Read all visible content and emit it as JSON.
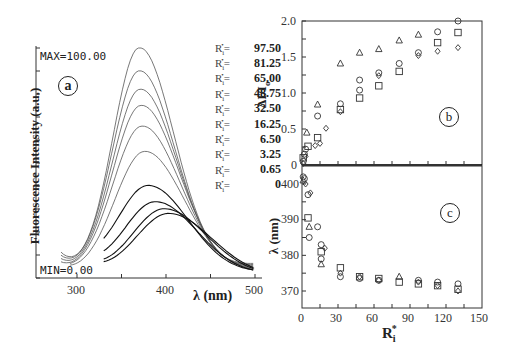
{
  "figure": {
    "panel_a": {
      "label": "a",
      "max_text": "MAX=100.00",
      "min_text": "MIN=0.00",
      "ylabel": "Fluorescence Intensity (a.u.)",
      "xlabel": "λ (nm)",
      "xticks": [
        "300",
        "400",
        "500"
      ],
      "legend_prefix": "Ri* =",
      "legend": [
        "97.50",
        "81.25",
        "65.00",
        "48.75",
        "32.50",
        "16.25",
        "6.50",
        "3.25",
        "0.65",
        "0"
      ]
    },
    "panel_b": {
      "label": "b",
      "ylabel": "ΔI/I0",
      "yticks": [
        "2.0",
        "1.5",
        "1.0",
        "0.5",
        "0"
      ]
    },
    "panel_c": {
      "label": "c",
      "ylabel": "λ (nm)",
      "yticks": [
        "400",
        "390",
        "380",
        "370"
      ],
      "xticks": [
        "0",
        "30",
        "60",
        "90",
        "120",
        "150"
      ],
      "xlabel": "Ri*"
    }
  },
  "chart_data": [
    {
      "type": "line",
      "title": "(a) Fluorescence emission spectra",
      "xlabel": "λ (nm)",
      "ylabel": "Fluorescence Intensity (a.u.)",
      "xlim": [
        255,
        500
      ],
      "ylim": [
        0,
        100
      ],
      "annotations": [
        "MAX=100.00",
        "MIN=0.00"
      ],
      "legend_title": "Ri*",
      "series": [
        {
          "name": "Ri* = 97.50",
          "peak_x": 370,
          "peak_y": 100
        },
        {
          "name": "Ri* = 81.25",
          "peak_x": 370,
          "peak_y": 90
        },
        {
          "name": "Ri* = 65.00",
          "peak_x": 371,
          "peak_y": 82
        },
        {
          "name": "Ri* = 48.75",
          "peak_x": 372,
          "peak_y": 75
        },
        {
          "name": "Ri* = 32.50",
          "peak_x": 373,
          "peak_y": 66
        },
        {
          "name": "Ri* = 16.25",
          "peak_x": 376,
          "peak_y": 55
        },
        {
          "name": "Ri* = 6.50",
          "peak_x": 380,
          "peak_y": 40
        },
        {
          "name": "Ri* = 3.25",
          "peak_x": 388,
          "peak_y": 33
        },
        {
          "name": "Ri* = 0.65",
          "peak_x": 398,
          "peak_y": 30
        },
        {
          "name": "Ri* = 0",
          "peak_x": 403,
          "peak_y": 28
        }
      ]
    },
    {
      "type": "scatter",
      "title": "(b)",
      "xlabel": "Ri*",
      "ylabel": "ΔI/I0",
      "xlim": [
        0,
        150
      ],
      "ylim": [
        0,
        2.0
      ],
      "series": [
        {
          "name": "triangle",
          "x": [
            4,
            13,
            32,
            48,
            64,
            81,
            97
          ],
          "y": [
            0.45,
            0.84,
            1.41,
            1.56,
            1.61,
            1.73,
            1.81
          ]
        },
        {
          "name": "circle",
          "x": [
            1,
            2,
            3,
            13,
            32,
            48,
            48,
            64,
            81,
            97,
            113,
            130
          ],
          "y": [
            0.05,
            0.15,
            0.22,
            0.68,
            0.85,
            1.18,
            1.04,
            1.28,
            1.41,
            1.56,
            1.85,
            2.0
          ]
        },
        {
          "name": "square",
          "x": [
            1,
            5,
            13,
            32,
            48,
            64,
            81,
            113,
            130
          ],
          "y": [
            0.1,
            0.26,
            0.38,
            0.77,
            0.93,
            1.1,
            1.3,
            1.7,
            1.84
          ]
        },
        {
          "name": "diamond",
          "x": [
            1,
            3,
            11,
            15,
            20,
            32,
            64,
            97,
            113,
            130
          ],
          "y": [
            0.02,
            0.12,
            0.27,
            0.3,
            0.51,
            0.74,
            1.24,
            1.52,
            1.58,
            1.63
          ]
        }
      ]
    },
    {
      "type": "scatter",
      "title": "(c)",
      "xlabel": "Ri*",
      "ylabel": "λ (nm)",
      "xlim": [
        0,
        150
      ],
      "ylim": [
        365,
        403
      ],
      "series": [
        {
          "name": "triangle",
          "x": [
            1,
            6,
            16,
            81
          ],
          "y": [
            401,
            388,
            377.5,
            374
          ]
        },
        {
          "name": "circle",
          "x": [
            1,
            2,
            5,
            6,
            13,
            16,
            16,
            32,
            48,
            64,
            97,
            113,
            130
          ],
          "y": [
            402,
            401.5,
            397,
            385,
            388,
            383,
            379,
            374,
            373.5,
            373,
            373,
            372.5,
            372
          ]
        },
        {
          "name": "square",
          "x": [
            5,
            16,
            32,
            48,
            64,
            81,
            97,
            113,
            130
          ],
          "y": [
            390.5,
            381,
            376.5,
            374,
            373.5,
            372.5,
            372,
            371.5,
            370.5
          ]
        },
        {
          "name": "diamond",
          "x": [
            3,
            7,
            19,
            32,
            48,
            64,
            97,
            113,
            130
          ],
          "y": [
            400,
            397.5,
            382,
            375,
            374,
            373,
            372.5,
            371.5,
            370
          ]
        }
      ]
    }
  ]
}
